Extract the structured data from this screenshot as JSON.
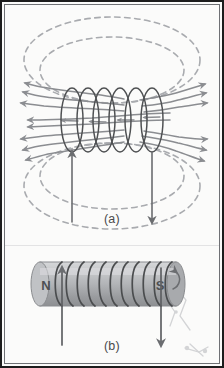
{
  "figure": {
    "background_color": "#fbfbfa",
    "frame_color": "#1d1d1d",
    "inner_frame_color": "#6f7175",
    "field_line_color": "#8b8d91",
    "dashed_line_color": "#a9abaf",
    "coil_color": "#555759",
    "wire_color": "#6b6d70",
    "magnet_body_color": "#b9bbbd",
    "magnet_edge_color": "#87898c"
  },
  "panels": [
    {
      "id": "a",
      "caption": "(a)",
      "description": "Solenoid coil shown in side view with magnetic field lines looping from one end to the other; field lines inside the coil point to the left, outside lines loop around above and below.",
      "coil_turns": 6,
      "interior_field_lines": 5,
      "dashed_outer_loops_top": 2,
      "dashed_outer_loops_bottom": 2,
      "lead_wires": [
        {
          "name": "left-lead",
          "current_direction": "up"
        },
        {
          "name": "right-lead",
          "current_direction": "down"
        }
      ]
    },
    {
      "id": "b",
      "caption": "(b)",
      "description": "Equivalent bar magnet representation of the solenoid: a cylinder wrapped with coil turns, labeled N at the left end and S at the right end.",
      "coil_turns": 11,
      "pole_labels": {
        "north": "N",
        "south": "S"
      },
      "lead_wires": [
        {
          "name": "left-lead",
          "current_direction": "up"
        },
        {
          "name": "right-lead",
          "current_direction": "down"
        }
      ]
    }
  ],
  "captions": {
    "a": "(a)",
    "b": "(b)"
  },
  "pole_labels": {
    "north": "N",
    "south": "S"
  }
}
